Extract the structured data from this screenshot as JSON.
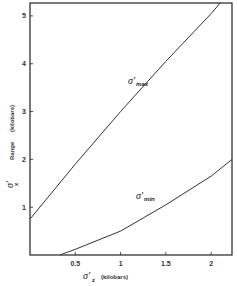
{
  "chart_data": {
    "type": "line",
    "title": "",
    "xlabel": "σ'z (kilobars)",
    "ylabel": "σ'x Range (kilobars)",
    "xlim": [
      0,
      2.23
    ],
    "ylim": [
      0,
      5.27
    ],
    "x_ticks": [
      "0.5",
      "1",
      "1.5",
      "2"
    ],
    "y_ticks": [
      "1",
      "2",
      "3",
      "4",
      "5"
    ],
    "grid": false,
    "legend": "inline labels",
    "series": [
      {
        "name": "σmax",
        "x": [
          0,
          0.5,
          1.0,
          1.5,
          2.0,
          2.1
        ],
        "y": [
          0.75,
          1.9,
          3.0,
          4.05,
          5.05,
          5.27
        ]
      },
      {
        "name": "σmin",
        "x": [
          0.33,
          0.5,
          1.0,
          1.5,
          2.0,
          2.23
        ],
        "y": [
          0,
          0.12,
          0.5,
          1.05,
          1.65,
          2.0
        ]
      }
    ]
  },
  "labels": {
    "sigma_max_main": "σ'",
    "sigma_max_sub": "max",
    "sigma_min_main": "σ'",
    "sigma_min_sub": "min",
    "x_axis_sigma": "σ'",
    "x_axis_sub": "z",
    "x_axis_units": "(kilobars)",
    "y_axis_sigma": "σ'",
    "y_axis_sub": "x",
    "y_axis_range": "Range",
    "y_axis_units": "(kilobars)"
  }
}
